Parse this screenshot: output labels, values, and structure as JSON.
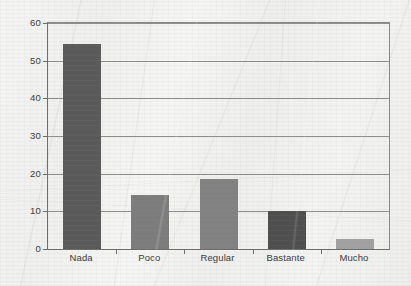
{
  "chart_data": {
    "type": "bar",
    "title": "",
    "subtitle": "",
    "xlabel": "",
    "ylabel": "",
    "categories": [
      "Nada",
      "Poco",
      "Regular",
      "Bastante",
      "Mucho"
    ],
    "values": [
      54.5,
      14.3,
      18.6,
      10.0,
      2.6
    ],
    "series": [
      {
        "name": "",
        "values": [
          54.5,
          14.3,
          18.6,
          10.0,
          2.6
        ]
      }
    ],
    "bar_colors": [
      "#5a5a5a",
      "#7c7c7c",
      "#818181",
      "#4f4f4f",
      "#a0a0a0"
    ],
    "ylim": [
      0,
      60
    ],
    "yticks": [
      0,
      10,
      20,
      30,
      40,
      50,
      60
    ],
    "ytick_labels": [
      "0",
      "10",
      "20",
      "30",
      "40",
      "50",
      "60"
    ],
    "grid": true,
    "grid_axis": "y",
    "legend": false,
    "legend_position": "none",
    "annotations": []
  },
  "figure": {
    "background_color": "#f1f1ef",
    "axis_color": "#6d6d6d",
    "grid_color": "#8e8e8e",
    "text_color": "#3a3a3a"
  }
}
